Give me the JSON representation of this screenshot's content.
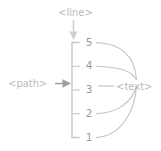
{
  "diagram": {
    "background": "#ffffff",
    "annotations": {
      "line": {
        "label": "<line>",
        "color": "#b9b9b9",
        "points_to": "tick-marks"
      },
      "path": {
        "label": "<path>",
        "color": "#b9b9b9",
        "points_to": "axis-domain-line"
      },
      "text": {
        "label": "<text>",
        "color": "#b9b9b9",
        "points_to": "tick-labels"
      }
    },
    "axis": {
      "orientation": "vertical",
      "stroke": "#c6c6c6",
      "tick_stroke": "#c9c9c9",
      "tick_label_color": "#9a9a9a",
      "ticks": [
        {
          "label": "5"
        },
        {
          "label": "4"
        },
        {
          "label": "3"
        },
        {
          "label": "2"
        },
        {
          "label": "1"
        }
      ]
    },
    "curves": {
      "stroke": "#c2c2c2",
      "count": 4,
      "description": "leader curves from tick labels 5, 4, 2, 1 converging at the <text> annotation"
    }
  }
}
